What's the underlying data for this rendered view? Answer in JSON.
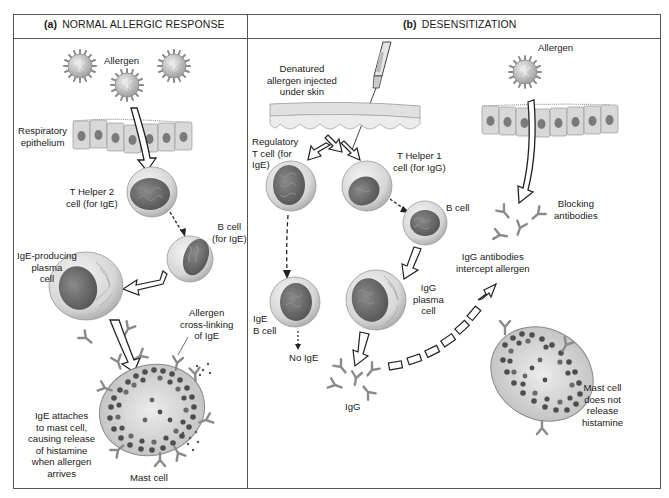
{
  "panels": {
    "a": {
      "letter": "(a)",
      "title": "NORMAL ALLERGIC RESPONSE",
      "labels": {
        "allergen": "Allergen",
        "epithelium": [
          "Respiratory",
          "epithelium"
        ],
        "th2": [
          "T Helper 2",
          "cell (for IgE)"
        ],
        "bcell": [
          "B cell",
          "(for IgE)"
        ],
        "plasma": [
          "IgE-producing",
          "plasma",
          "cell"
        ],
        "crosslink": [
          "Allergen",
          "cross-linking",
          "of IgE"
        ],
        "attach": [
          "IgE attaches",
          "to mast cell,",
          "causing release",
          "of histamine",
          "when allergen",
          "arrives"
        ],
        "mast": "Mast cell"
      }
    },
    "b": {
      "letter": "(b)",
      "title": "DESENSITIZATION",
      "labels": {
        "injected": [
          "Denatured",
          "allergen injected",
          "under skin"
        ],
        "allergen": "Allergen",
        "treg": [
          "Regulatory",
          "T cell (for",
          "IgE)"
        ],
        "th1": [
          "T Helper 1",
          "cell (for IgG)"
        ],
        "bcell": "B cell",
        "ige_b": [
          "IgE",
          "B cell"
        ],
        "no_ige": "No IgE",
        "igg_plasma": [
          "IgG",
          "plasma",
          "cell"
        ],
        "igg": "IgG",
        "blocking": [
          "Blocking",
          "antibodies"
        ],
        "intercept": [
          "IgG antibodies",
          "intercept allergen"
        ],
        "mast": [
          "Mast cell",
          "does not",
          "release",
          "histamine"
        ]
      }
    }
  },
  "colors": {
    "border": "#555555",
    "cell_membrane": "#cfcfcf",
    "nucleus": "#6a6a6a",
    "granule": "#4a4a4a",
    "antibody": "#8a8a8a"
  }
}
